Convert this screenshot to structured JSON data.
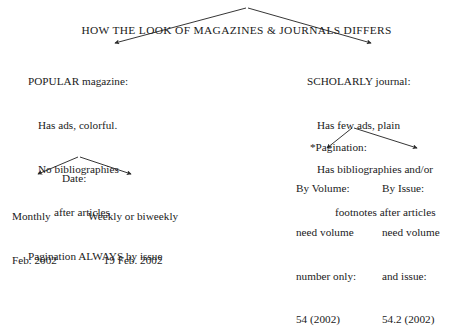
{
  "diagram": {
    "type": "hierarchy-tree",
    "background_color": "#ffffff",
    "text_color": "#1a1a1a",
    "line_color": "#2b2b2b",
    "title": "HOW THE LOOK OF MAGAZINES & JOURNALS DIFFERS",
    "branches": {
      "popular": {
        "heading": "POPULAR magazine:",
        "lines": [
          "Has ads, colorful.",
          "No bibliographies",
          "after articles",
          "Pagination ALWAYS by issue"
        ],
        "sub_label": "Date:",
        "leaves": [
          {
            "label": "Monthly",
            "example": "Feb. 2002"
          },
          {
            "label": "Weekly or biweekly",
            "example": "19 Feb. 2002"
          }
        ]
      },
      "scholarly": {
        "heading": "SCHOLARLY journal:",
        "lines": [
          "Has few ads, plain",
          "Has bibliographies and/or",
          "footnotes after articles"
        ],
        "sub_label": "*Pagination:",
        "leaves": [
          {
            "label": "By Volume:",
            "detail_line_1": "need volume",
            "detail_line_2": "number only:",
            "example": "54 (2002)"
          },
          {
            "label": "By Issue:",
            "detail_line_1": "need volume",
            "detail_line_2": "and issue:",
            "example": "54.2 (2002)"
          }
        ]
      }
    }
  }
}
